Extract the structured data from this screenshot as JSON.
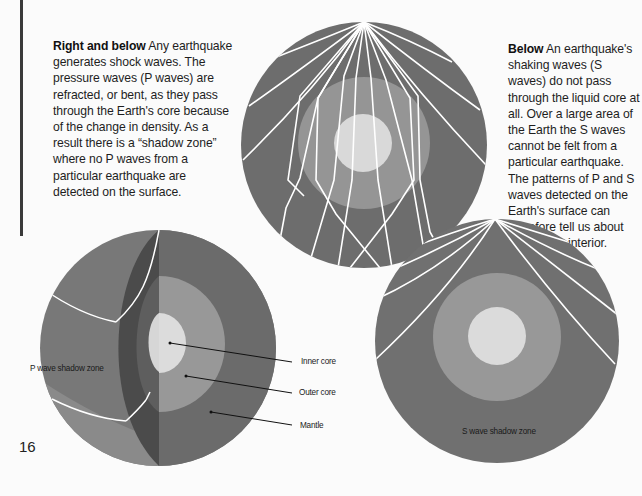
{
  "captions": {
    "left": {
      "lead": "Right and below",
      "body": " Any earthquake generates shock waves. The pressure waves (P waves) are refracted, or bent, as they pass through the Earth's core because of the change in density. As a result there is a “shadow zone” where no P waves from a particular earthquake are detected on the surface."
    },
    "right": {
      "lead": "Below",
      "body": " An earthquake's shaking waves (S waves) do not pass through the liquid core at all. Over a large area of the Earth the S waves cannot be felt from a particular earthquake. The patterns of P and S waves detected on the Earth's surface can therefore tell us about the Earth's interior."
    }
  },
  "figures": {
    "cutaway_globe": {
      "labels": {
        "inner_core": "Inner core",
        "outer_core": "Outer core",
        "mantle": "Mantle",
        "shadow_zone": "P wave shadow zone"
      }
    },
    "p_wave_diagram": {
      "description": "P waves refracted through core"
    },
    "s_wave_diagram": {
      "shadow_zone": "S wave shadow zone"
    }
  },
  "colors": {
    "mantle": "#6f6f6f",
    "outer_core": "#9a9a9a",
    "inner_core": "#dadada",
    "cut_face": "#4a4a4a",
    "waves": "#ffffff",
    "page": "#fbfbfb"
  },
  "page_number": "16"
}
